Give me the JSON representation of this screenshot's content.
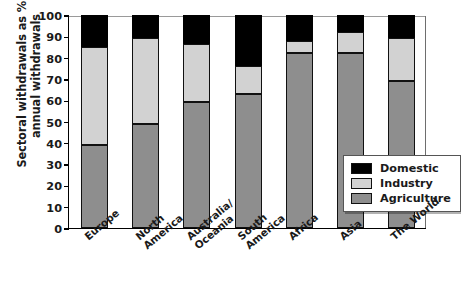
{
  "chart_data": {
    "type": "bar",
    "subtype": "stacked-bar",
    "title": "",
    "xlabel": "",
    "ylabel": "Sectoral withdrawals as % of annual withdrawals",
    "ylabel_lines": [
      "Sectoral withdrawals as % of",
      "annual withdrawals"
    ],
    "ylim": [
      0,
      100
    ],
    "yticks": [
      0,
      10,
      20,
      30,
      40,
      50,
      60,
      70,
      80,
      90,
      100
    ],
    "ytick_labels": [
      "0",
      "10",
      "20",
      "30",
      "40",
      "50",
      "60",
      "70",
      "80",
      "90",
      "100"
    ],
    "grid": false,
    "legend_position": "center-right-inside",
    "stack_order_bottom_to_top": [
      "Agriculture",
      "Industry",
      "Domestic"
    ],
    "categories": [
      "Europe",
      "North America",
      "Australia/ Oceania",
      "South America",
      "Africa",
      "Asia",
      "The World"
    ],
    "category_label_lines": [
      [
        "Europe"
      ],
      [
        "North",
        "America"
      ],
      [
        "Australia/",
        "Oceania"
      ],
      [
        "South",
        "America"
      ],
      [
        "Africa"
      ],
      [
        "Asia"
      ],
      [
        "The World"
      ]
    ],
    "series": [
      {
        "name": "Agriculture",
        "color": "#8e8e8e",
        "values": [
          39,
          49,
          59,
          63,
          82,
          82,
          69
        ]
      },
      {
        "name": "Industry",
        "color": "#d2d2d2",
        "values": [
          46,
          40,
          27.5,
          13,
          6,
          10,
          20
        ]
      },
      {
        "name": "Domestic",
        "color": "#000000",
        "values": [
          15,
          11,
          13.5,
          24,
          12,
          8,
          11
        ]
      }
    ],
    "cumulative_tops": [
      {
        "category": "Europe",
        "agriculture": 39,
        "industry": 85,
        "domestic": 100
      },
      {
        "category": "North America",
        "agriculture": 49,
        "industry": 89,
        "domestic": 100
      },
      {
        "category": "Australia/ Oceania",
        "agriculture": 59,
        "industry": 86.5,
        "domestic": 100
      },
      {
        "category": "South America",
        "agriculture": 63,
        "industry": 76,
        "domestic": 100
      },
      {
        "category": "Africa",
        "agriculture": 82,
        "industry": 88,
        "domestic": 100
      },
      {
        "category": "Asia",
        "agriculture": 82,
        "industry": 92,
        "domestic": 100
      },
      {
        "category": "The World",
        "agriculture": 69,
        "industry": 89,
        "domestic": 100
      }
    ],
    "legend": [
      {
        "label": "Domestic",
        "color": "#000000"
      },
      {
        "label": "Industry",
        "color": "#d2d2d2"
      },
      {
        "label": "Agriculture",
        "color": "#8e8e8e"
      }
    ]
  }
}
